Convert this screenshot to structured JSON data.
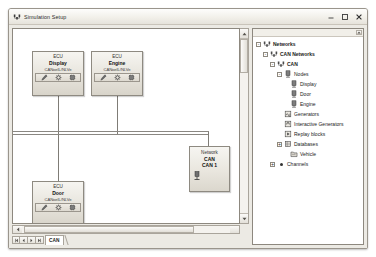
{
  "window": {
    "title": "Simulation Setup",
    "icon": "vector-network-icon",
    "controls": [
      {
        "name": "minimize-button",
        "glyph": "minimize"
      },
      {
        "name": "maximize-button",
        "glyph": "maximize"
      },
      {
        "name": "close-button",
        "glyph": "close"
      }
    ]
  },
  "canvas": {
    "nodes": [
      {
        "id": "display",
        "kind": "ECU",
        "name": "Display",
        "sub": "CANoeIL/NLVe",
        "icons": [
          "pencil-icon",
          "gear-icon",
          "chip-icon"
        ]
      },
      {
        "id": "engine",
        "kind": "ECU",
        "name": "Engine",
        "sub": "CANoeIL/NLVe",
        "icons": [
          "pencil-icon",
          "gear-icon",
          "chip-icon"
        ]
      },
      {
        "id": "door",
        "kind": "ECU",
        "name": "Door",
        "sub": "CANoeIL/NLVe",
        "icons": [
          "pencil-icon",
          "gear-icon",
          "chip-icon"
        ]
      }
    ],
    "network": {
      "id": "network-can",
      "kind": "Network",
      "name": "CAN",
      "sub": "CAN 1",
      "icon": "bus-connector-icon"
    }
  },
  "bottom": {
    "nav": [
      {
        "name": "nav-first-button",
        "glyph": "first"
      },
      {
        "name": "nav-prev-button",
        "glyph": "prev"
      },
      {
        "name": "nav-next-button",
        "glyph": "next"
      },
      {
        "name": "nav-last-button",
        "glyph": "last"
      }
    ],
    "sheet_tab": "CAN"
  },
  "tree": {
    "items": [
      {
        "label": "Networks",
        "depth": 0,
        "icon": "network-icon",
        "expander": "-",
        "bold": true
      },
      {
        "label": "CAN Networks",
        "depth": 1,
        "icon": "network-icon",
        "expander": "-",
        "bold": true
      },
      {
        "label": "CAN",
        "depth": 2,
        "icon": "network-icon",
        "expander": "-",
        "bold": true
      },
      {
        "label": "Nodes",
        "depth": 3,
        "icon": "node-icon",
        "expander": "-",
        "bold": false
      },
      {
        "label": "Display",
        "depth": 4,
        "icon": "node-icon",
        "expander": "",
        "bold": false
      },
      {
        "label": "Door",
        "depth": 4,
        "icon": "node-icon",
        "expander": "",
        "bold": false
      },
      {
        "label": "Engine",
        "depth": 4,
        "icon": "node-icon",
        "expander": "",
        "bold": false
      },
      {
        "label": "Generators",
        "depth": 3,
        "icon": "generator-icon",
        "expander": "",
        "bold": false
      },
      {
        "label": "Interactive Generators",
        "depth": 3,
        "icon": "interactive-generator-icon",
        "expander": "",
        "bold": false
      },
      {
        "label": "Replay blocks",
        "depth": 3,
        "icon": "replay-block-icon",
        "expander": "",
        "bold": false
      },
      {
        "label": "Databases",
        "depth": 3,
        "icon": "database-icon",
        "expander": "+",
        "bold": false
      },
      {
        "label": "Vehicle",
        "depth": 4,
        "icon": "database-file-icon",
        "expander": "",
        "bold": false
      },
      {
        "label": "Channels",
        "depth": 2,
        "icon": "bullet-icon",
        "expander": "+",
        "bold": false
      }
    ]
  },
  "colors": {
    "window_bg": "#eceae4",
    "canvas_bg": "#ffffff",
    "border": "#8d887f",
    "wire": "#7f7c76"
  }
}
